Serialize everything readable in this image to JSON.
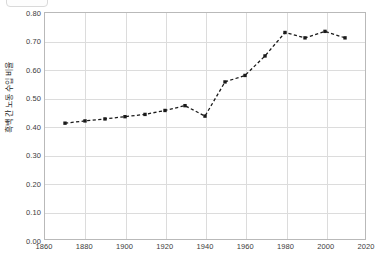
{
  "chart_data": {
    "type": "line",
    "title": "",
    "subtitle": "",
    "xlabel": "",
    "ylabel": "흑백 간 노동 수입 비율",
    "xlim": [
      1860,
      2020
    ],
    "ylim": [
      0.0,
      0.8
    ],
    "xticks": [
      1860,
      1880,
      1900,
      1920,
      1940,
      1960,
      1980,
      2000,
      2020
    ],
    "xtick_labels": [
      "1860",
      "1880",
      "1900",
      "1920",
      "1940",
      "1960",
      "1980",
      "2000",
      "2020"
    ],
    "yticks": [
      0.0,
      0.1,
      0.2,
      0.3,
      0.4,
      0.5,
      0.6,
      0.7,
      0.8
    ],
    "ytick_labels": [
      "0.00",
      "0.10",
      "0.20",
      "0.30",
      "0.40",
      "0.50",
      "0.60",
      "0.70",
      "0.80"
    ],
    "grid": true,
    "legend": "none",
    "line_style": "dashed",
    "marker": "square",
    "series_color": "#1a1a1a",
    "grid_color": "#dcdcdc",
    "frame_color": "#b9b9b9",
    "x": [
      1870,
      1880,
      1890,
      1900,
      1910,
      1920,
      1930,
      1940,
      1950,
      1960,
      1970,
      1980,
      1990,
      2000,
      2010
    ],
    "values": [
      0.41,
      0.418,
      0.425,
      0.433,
      0.441,
      0.455,
      0.472,
      0.435,
      0.556,
      0.579,
      0.648,
      0.731,
      0.712,
      0.735,
      0.712
    ],
    "series": [
      {
        "name": "흑백 간 노동 수입 비율",
        "values": [
          0.41,
          0.418,
          0.425,
          0.433,
          0.441,
          0.455,
          0.472,
          0.435,
          0.556,
          0.579,
          0.648,
          0.731,
          0.712,
          0.735,
          0.712
        ]
      }
    ]
  }
}
